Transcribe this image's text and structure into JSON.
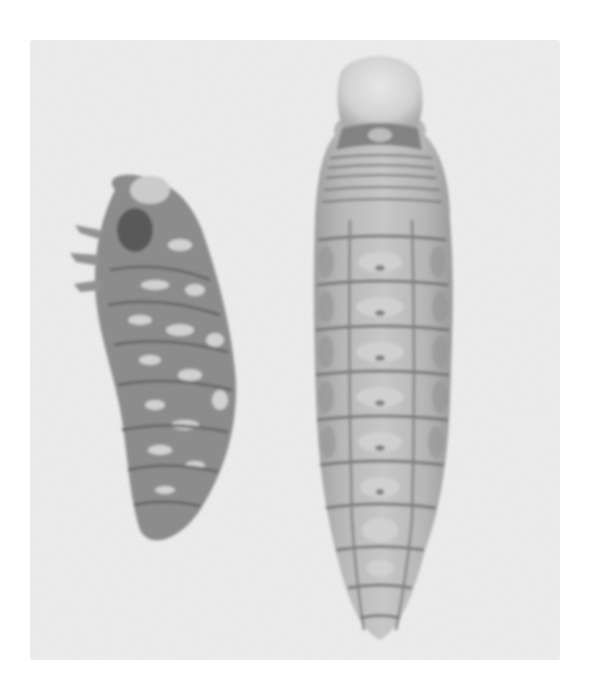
{
  "image": {
    "description": "Grayscale photograph of two insect larvae on a light gray background",
    "background_color": "#efefef",
    "page_color": "#ffffff",
    "subjects": [
      {
        "name": "left-larva",
        "description": "Curled, mottled dark larva",
        "tone": "#7a7a7a"
      },
      {
        "name": "right-larva",
        "description": "Elongated segmented larva with pale head capsule",
        "tone": "#a6a6a6"
      }
    ]
  }
}
